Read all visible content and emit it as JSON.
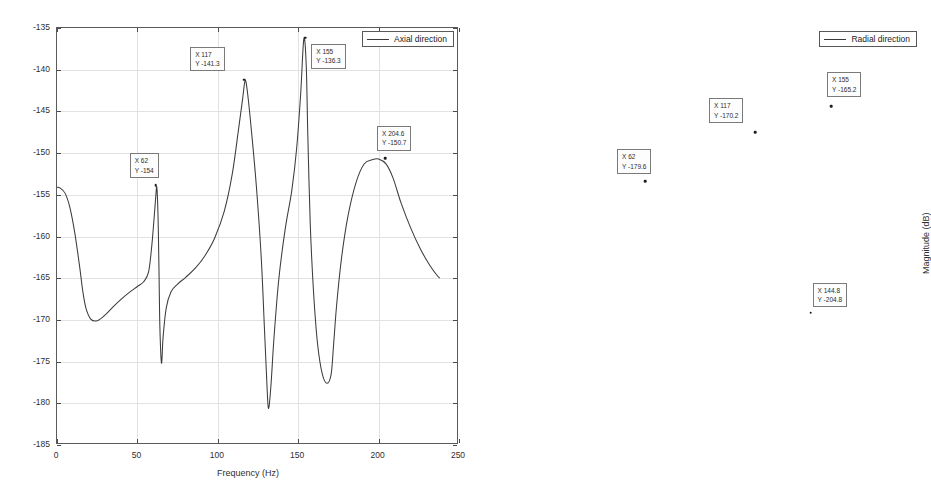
{
  "figure": {
    "panel_count": 2,
    "background": "#ffffff",
    "line_color": "#3c3c3c"
  },
  "chart_data": [
    {
      "type": "line",
      "title": "",
      "xlabel": "Frequency (Hz)",
      "ylabel": "Magnitude (dB)",
      "xlim": [
        0,
        250
      ],
      "ylim": [
        -185,
        -135
      ],
      "xticks": [
        0,
        50,
        100,
        150,
        200,
        250
      ],
      "yticks": [
        -135,
        -140,
        -145,
        -150,
        -155,
        -160,
        -165,
        -170,
        -175,
        -180,
        -185
      ],
      "grid": true,
      "legend": {
        "position": "top-right",
        "entries": [
          "Axial direction"
        ]
      },
      "series": [
        {
          "name": "Axial direction",
          "x": [
            0,
            2,
            5,
            8,
            11,
            14,
            16,
            18,
            21,
            25,
            30,
            35,
            40,
            45,
            50,
            54,
            57,
            59,
            60.5,
            61.5,
            62,
            62.5,
            63,
            63.5,
            64,
            65,
            66,
            68,
            71,
            75,
            80,
            86,
            92,
            98,
            104,
            109,
            113,
            115.5,
            117,
            118.5,
            121,
            124,
            127,
            129,
            130.5,
            131.5,
            133,
            135,
            138,
            142,
            146,
            149,
            151.5,
            153.5,
            155,
            156,
            157.5,
            159.5,
            162,
            165,
            168,
            170.5,
            172,
            174,
            177,
            181,
            186,
            191,
            196,
            200,
            204.6,
            209,
            214,
            220,
            226,
            232,
            238,
            244,
            250
          ],
          "y": [
            -154.1,
            -154.2,
            -154.8,
            -156.5,
            -159.5,
            -163.5,
            -166.5,
            -168.6,
            -169.9,
            -170.1,
            -169.4,
            -168.4,
            -167.5,
            -166.7,
            -166.0,
            -165.4,
            -164.2,
            -161.0,
            -157.5,
            -155.0,
            -154.0,
            -155.5,
            -159.0,
            -165.0,
            -171.0,
            -175.2,
            -172.0,
            -168.5,
            -166.6,
            -165.7,
            -164.9,
            -163.8,
            -162.3,
            -160.2,
            -157.0,
            -152.5,
            -147.0,
            -143.4,
            -141.3,
            -142.8,
            -147.5,
            -154.0,
            -162.5,
            -171.0,
            -177.5,
            -180.6,
            -178.0,
            -172.0,
            -165.0,
            -159.0,
            -154.5,
            -149.5,
            -143.0,
            -136.3,
            -139.5,
            -148.0,
            -158.5,
            -166.5,
            -172.8,
            -176.5,
            -177.6,
            -176.5,
            -173.0,
            -168.0,
            -162.5,
            -157.5,
            -153.5,
            -151.3,
            -150.8,
            -150.7,
            -151.3,
            -153.0,
            -156.0,
            -159.0,
            -161.5,
            -163.5,
            -165.0,
            -165.8
          ]
        }
      ],
      "annotations": [
        {
          "x_label": "X 62",
          "y_label": "Y -154",
          "x": 62,
          "y": -154.0,
          "label_dx": -26,
          "label_dy": -32
        },
        {
          "x_label": "X 117",
          "y_label": "Y -141.3",
          "x": 117,
          "y": -141.3,
          "label_dx": -54,
          "label_dy": -33
        },
        {
          "x_label": "X 155",
          "y_label": "Y -136.3",
          "x": 155,
          "y": -136.3,
          "label_dx": 6,
          "label_dy": 6
        },
        {
          "x_label": "X 204.6",
          "y_label": "Y -150.7",
          "x": 204.6,
          "y": -150.7,
          "label_dx": -8,
          "label_dy": -32
        }
      ]
    },
    {
      "type": "line",
      "title": "",
      "xlabel": "Frequency (Hz)",
      "ylabel": "Magnitude (dB)",
      "xlim": [
        0,
        200
      ],
      "ylim": [
        -230,
        -150
      ],
      "xticks": [
        0,
        20,
        40,
        60,
        80,
        100,
        120,
        140,
        160,
        180,
        200
      ],
      "yticks": [
        -150,
        -160,
        -170,
        -180,
        -190,
        -200,
        -210,
        -220,
        -230
      ],
      "grid": true,
      "legend": {
        "position": "top-right",
        "entries": [
          "Radial direction"
        ]
      },
      "series": [
        {
          "name": "Radial direction",
          "x": [
            0,
            1.5,
            3,
            5,
            7,
            9,
            12,
            15,
            19,
            23,
            28,
            33,
            38,
            43,
            48,
            52,
            56,
            59,
            61,
            62,
            63,
            64,
            65,
            67,
            70,
            73,
            76,
            79,
            80.5,
            82,
            84,
            87,
            91,
            96,
            101,
            106,
            110,
            113.5,
            116,
            117,
            118.5,
            121,
            124,
            128,
            132,
            136,
            139,
            141.5,
            143,
            144,
            144.8,
            145.5,
            146.5,
            148,
            150,
            152,
            153.5,
            154.5,
            155,
            156,
            157.5,
            159.5,
            162,
            165,
            169,
            173,
            178,
            183,
            188,
            193,
            197,
            200
          ],
          "y": [
            -157.2,
            -157.0,
            -157.3,
            -158.2,
            -159.6,
            -161.2,
            -163.6,
            -166.0,
            -169.0,
            -171.8,
            -174.8,
            -177.5,
            -180.1,
            -182.6,
            -184.9,
            -185.0,
            -183.0,
            -181.5,
            -180.2,
            -179.6,
            -181.0,
            -184.0,
            -188.5,
            -196.0,
            -202.5,
            -203.4,
            -201.0,
            -205.0,
            -214.0,
            -221.8,
            -218.0,
            -210.0,
            -202.0,
            -195.0,
            -189.0,
            -183.5,
            -178.5,
            -173.5,
            -171.0,
            -170.2,
            -171.5,
            -175.0,
            -180.5,
            -188.5,
            -197.5,
            -208.0,
            -217.0,
            -225.0,
            -229.5,
            -230.0,
            -204.8,
            -206.5,
            -212.0,
            -205.0,
            -197.0,
            -186.5,
            -177.0,
            -169.5,
            -165.2,
            -167.5,
            -173.0,
            -180.0,
            -185.5,
            -189.5,
            -191.6,
            -192.3,
            -192.5,
            -192.4,
            -192.3,
            -192.2,
            -192.2,
            -192.2
          ]
        }
      ],
      "annotations": [
        {
          "x_label": "X 62",
          "y_label": "Y -179.6",
          "x": 62,
          "y": -179.6,
          "label_dx": -28,
          "label_dy": -32
        },
        {
          "x_label": "X 117",
          "y_label": "Y -170.2",
          "x": 117,
          "y": -170.2,
          "label_dx": -46,
          "label_dy": -34
        },
        {
          "x_label": "X 155",
          "y_label": "Y -165.2",
          "x": 155,
          "y": -165.2,
          "label_dx": -4,
          "label_dy": -34
        },
        {
          "x_label": "X 144.8",
          "y_label": "Y -204.8",
          "x": 144.8,
          "y": -204.8,
          "label_dx": 2,
          "label_dy": -30
        }
      ]
    }
  ]
}
